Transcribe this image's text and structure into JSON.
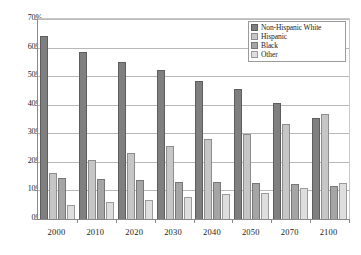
{
  "chart_data": {
    "type": "bar",
    "title": "",
    "xlabel": "",
    "ylabel": "",
    "ylim": [
      0,
      70
    ],
    "ytick_labels": [
      "70%",
      "60%",
      "50%",
      "40%",
      "30%",
      "20%",
      "10%",
      "0%"
    ],
    "ytick_values": [
      70,
      60,
      50,
      40,
      30,
      20,
      10,
      0
    ],
    "grid": true,
    "legend_position": "top-right",
    "categories": [
      "2000",
      "2010",
      "2020",
      "2030",
      "2040",
      "2050",
      "2070",
      "2100"
    ],
    "series": [
      {
        "name": "Non-Hispanic White",
        "color": "#7f7f7f",
        "values": [
          64.0,
          58.6,
          55.0,
          52.1,
          48.4,
          45.5,
          40.6,
          35.3
        ]
      },
      {
        "name": "Hispanic",
        "color": "#c6c6c6",
        "values": [
          16.1,
          20.6,
          23.1,
          25.4,
          27.9,
          29.8,
          33.4,
          36.9
        ]
      },
      {
        "name": "Black",
        "color": "#a5a5a5",
        "values": [
          14.4,
          14.0,
          13.8,
          13.1,
          12.9,
          12.6,
          12.3,
          11.7
        ]
      },
      {
        "name": "Other",
        "color": "#dedede",
        "values": [
          5.0,
          6.1,
          6.7,
          7.7,
          8.7,
          9.2,
          10.7,
          12.6
        ]
      }
    ]
  }
}
